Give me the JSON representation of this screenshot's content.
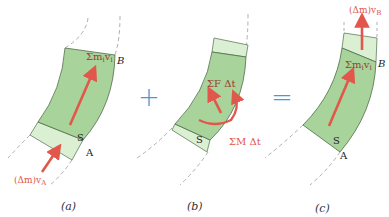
{
  "colors": {
    "region_fill": "#a8d39b",
    "band_fill": "#dbefd3",
    "outline": "#4f6b4a",
    "arrow": "#e2574c",
    "operator": "#3aa0d8",
    "dashed": "#9a9a9a"
  },
  "panels": [
    {
      "id": "a",
      "caption": "(a)",
      "labels": {
        "sum_momentum": "Σm",
        "sum_momentum_sub": "i",
        "sum_momentum_v": "v",
        "sum_momentum_v_sub": "i",
        "point_b": "B",
        "point_a": "A",
        "system": "S",
        "inflow": "(Δm)v",
        "inflow_sub": "A"
      }
    },
    {
      "id": "b",
      "caption": "(b)",
      "labels": {
        "impulse_force": "ΣF Δt",
        "impulse_moment": "ΣM Δt",
        "system": "S"
      }
    },
    {
      "id": "c",
      "caption": "(c)",
      "labels": {
        "sum_momentum": "Σm",
        "sum_momentum_sub": "i",
        "sum_momentum_v": "v",
        "sum_momentum_v_sub": "i",
        "point_b": "B",
        "point_a": "A",
        "system": "S",
        "outflow": "(Δm)v",
        "outflow_sub": "B"
      }
    }
  ],
  "operators": {
    "plus": "+",
    "equals": "="
  }
}
